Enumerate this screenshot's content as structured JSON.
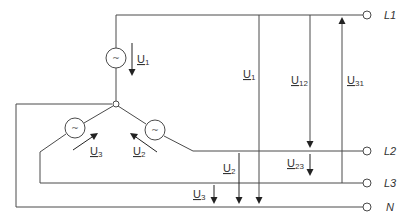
{
  "terminals": [
    {
      "id": "L1",
      "label": "L1"
    },
    {
      "id": "L2",
      "label": "L2"
    },
    {
      "id": "L3",
      "label": "L3"
    },
    {
      "id": "N",
      "label": "N"
    }
  ],
  "sources": [
    {
      "id": "source-1",
      "symbol": "~"
    },
    {
      "id": "source-2",
      "symbol": "~"
    },
    {
      "id": "source-3",
      "symbol": "~"
    }
  ],
  "voltages": {
    "phase_source": [
      {
        "id": "U1",
        "main": "U",
        "sub": "1"
      },
      {
        "id": "U2",
        "main": "U",
        "sub": "2"
      },
      {
        "id": "U3",
        "main": "U",
        "sub": "3"
      }
    ],
    "phase_network": [
      {
        "id": "U1",
        "main": "U",
        "sub": "1"
      },
      {
        "id": "U2",
        "main": "U",
        "sub": "2"
      },
      {
        "id": "U3",
        "main": "U",
        "sub": "3"
      }
    ],
    "line": [
      {
        "id": "U12",
        "main": "U",
        "sub": "12"
      },
      {
        "id": "U23",
        "main": "U",
        "sub": "23"
      },
      {
        "id": "U31",
        "main": "U",
        "sub": "31"
      }
    ]
  }
}
